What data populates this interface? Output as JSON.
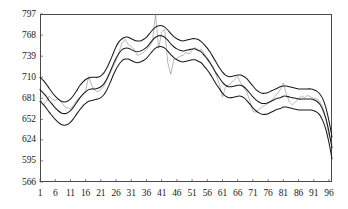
{
  "chart_data": {
    "type": "line",
    "title": "",
    "subtitle": "",
    "xlabel": "",
    "ylabel": "",
    "xlim": [
      1,
      97
    ],
    "ylim": [
      566,
      797
    ],
    "grid": false,
    "legend": "none",
    "y_ticks": [
      797,
      768,
      739,
      710,
      681,
      652,
      624,
      595,
      566
    ],
    "x_ticks": [
      1,
      6,
      11,
      16,
      21,
      26,
      31,
      36,
      41,
      46,
      51,
      56,
      61,
      66,
      71,
      76,
      81,
      86,
      91,
      96
    ],
    "x": [
      1,
      2,
      3,
      4,
      5,
      6,
      7,
      8,
      9,
      10,
      11,
      12,
      13,
      14,
      15,
      16,
      17,
      18,
      19,
      20,
      21,
      22,
      23,
      24,
      25,
      26,
      27,
      28,
      29,
      30,
      31,
      32,
      33,
      34,
      35,
      36,
      37,
      38,
      39,
      40,
      41,
      42,
      43,
      44,
      45,
      46,
      47,
      48,
      49,
      50,
      51,
      52,
      53,
      54,
      55,
      56,
      57,
      58,
      59,
      60,
      61,
      62,
      63,
      64,
      65,
      66,
      67,
      68,
      69,
      70,
      71,
      72,
      73,
      74,
      75,
      76,
      77,
      78,
      79,
      80,
      81,
      82,
      83,
      84,
      85,
      86,
      87,
      88,
      89,
      90,
      91,
      92,
      93,
      94,
      95,
      96,
      97
    ],
    "series": [
      {
        "name": "observed",
        "style": "thin-noisy",
        "color": "#7d7d7d",
        "values": [
          681,
          672,
          676,
          684,
          680,
          678,
          681,
          676,
          670,
          668,
          667,
          671,
          678,
          682,
          686,
          692,
          711,
          699,
          692,
          690,
          693,
          698,
          706,
          716,
          724,
          733,
          745,
          757,
          762,
          755,
          752,
          748,
          740,
          742,
          744,
          748,
          752,
          760,
          797,
          750,
          772,
          776,
          730,
          714,
          735,
          736,
          739,
          740,
          744,
          742,
          748,
          751,
          746,
          749,
          742,
          737,
          730,
          724,
          712,
          700,
          683,
          697,
          699,
          703,
          707,
          711,
          702,
          695,
          690,
          677,
          663,
          662,
          666,
          669,
          672,
          674,
          678,
          682,
          688,
          693,
          702,
          687,
          676,
          672,
          676,
          681,
          684,
          682,
          685,
          683,
          681,
          680,
          677,
          668,
          652,
          630,
          618
        ]
      },
      {
        "name": "upper-band",
        "style": "smooth",
        "color": "#1a1a1a",
        "values": [
          710,
          706,
          701,
          695,
          689,
          684,
          680,
          677,
          676,
          677,
          680,
          685,
          691,
          698,
          703,
          707,
          709,
          710,
          710,
          710,
          712,
          716,
          723,
          732,
          742,
          752,
          759,
          763,
          765,
          765,
          763,
          761,
          760,
          760,
          762,
          765,
          770,
          775,
          779,
          781,
          781,
          779,
          775,
          770,
          766,
          763,
          761,
          760,
          761,
          762,
          763,
          763,
          762,
          759,
          755,
          750,
          744,
          737,
          730,
          723,
          717,
          713,
          711,
          711,
          712,
          713,
          713,
          711,
          708,
          703,
          698,
          693,
          690,
          688,
          688,
          689,
          691,
          693,
          695,
          697,
          698,
          698,
          697,
          696,
          695,
          694,
          694,
          694,
          694,
          694,
          693,
          691,
          687,
          680,
          668,
          650,
          628
        ]
      },
      {
        "name": "fitted",
        "style": "smooth",
        "color": "#1a1a1a",
        "values": [
          693,
          689,
          684,
          678,
          673,
          668,
          664,
          661,
          660,
          661,
          664,
          669,
          675,
          681,
          686,
          690,
          693,
          694,
          694,
          695,
          697,
          701,
          708,
          717,
          727,
          736,
          743,
          748,
          750,
          750,
          748,
          746,
          745,
          746,
          748,
          751,
          756,
          761,
          765,
          767,
          767,
          765,
          761,
          756,
          752,
          749,
          747,
          746,
          747,
          748,
          749,
          749,
          747,
          745,
          740,
          735,
          729,
          722,
          715,
          709,
          703,
          699,
          697,
          697,
          698,
          699,
          699,
          697,
          693,
          688,
          683,
          679,
          676,
          674,
          674,
          675,
          677,
          679,
          681,
          682,
          684,
          684,
          683,
          682,
          681,
          680,
          680,
          680,
          680,
          680,
          679,
          677,
          673,
          665,
          653,
          635,
          613
        ]
      },
      {
        "name": "lower-band",
        "style": "smooth",
        "color": "#1a1a1a",
        "values": [
          677,
          673,
          668,
          662,
          657,
          652,
          648,
          645,
          644,
          645,
          648,
          653,
          659,
          665,
          670,
          674,
          677,
          678,
          679,
          680,
          682,
          686,
          693,
          702,
          712,
          721,
          728,
          733,
          735,
          735,
          733,
          731,
          730,
          731,
          733,
          736,
          741,
          746,
          750,
          752,
          752,
          750,
          746,
          741,
          737,
          734,
          732,
          731,
          732,
          733,
          734,
          734,
          732,
          730,
          725,
          720,
          714,
          707,
          700,
          694,
          688,
          684,
          682,
          682,
          683,
          684,
          684,
          682,
          678,
          673,
          668,
          664,
          661,
          659,
          659,
          660,
          662,
          664,
          666,
          667,
          669,
          669,
          668,
          667,
          666,
          665,
          665,
          665,
          665,
          665,
          664,
          662,
          658,
          650,
          638,
          620,
          598
        ]
      }
    ]
  },
  "axes": {
    "y_tick_labels": [
      "797",
      "768",
      "739",
      "710",
      "681",
      "652",
      "624",
      "595",
      "566"
    ],
    "x_tick_labels": [
      "1",
      "6",
      "11",
      "16",
      "21",
      "26",
      "31",
      "36",
      "41",
      "46",
      "51",
      "56",
      "61",
      "66",
      "71",
      "76",
      "81",
      "86",
      "91",
      "96"
    ]
  }
}
